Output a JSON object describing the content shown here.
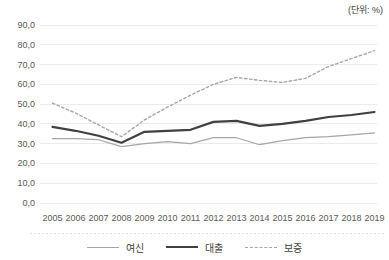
{
  "chart": {
    "unit_label": "(단위: %)",
    "colors": {
      "background": "#ffffff",
      "gridline": "#ebebeb",
      "axis_text": "#595959",
      "separator": "#e0e0e0",
      "series_gray": "#a6a6a6",
      "series_dark": "#404040"
    }
  },
  "chart_data": {
    "type": "line",
    "title": "",
    "unit": "(단위: %)",
    "categories": [
      "2005",
      "2006",
      "2007",
      "2008",
      "2009",
      "2010",
      "2011",
      "2012",
      "2013",
      "2014",
      "2015",
      "2016",
      "2017",
      "2018",
      "2019"
    ],
    "series": [
      {
        "name": "여신",
        "key": "yeosin",
        "color": "#a6a6a6",
        "width": 1.2,
        "dash": "",
        "values": [
          32.5,
          32.5,
          32.0,
          28.5,
          30.0,
          31.0,
          30.0,
          33.0,
          33.0,
          29.5,
          31.5,
          33.0,
          33.5,
          34.5,
          35.5
        ]
      },
      {
        "name": "대출",
        "key": "daechul",
        "color": "#404040",
        "width": 2.2,
        "dash": "",
        "values": [
          38.5,
          36.5,
          34.0,
          30.5,
          36.0,
          36.5,
          37.0,
          41.0,
          41.5,
          39.0,
          40.0,
          41.5,
          43.5,
          44.5,
          46.0
        ]
      },
      {
        "name": "보증",
        "key": "bojeung",
        "color": "#a6a6a6",
        "width": 1.4,
        "dash": "2.5,2.5",
        "values": [
          50.5,
          45.5,
          39.5,
          33.5,
          42.0,
          48.5,
          54.5,
          60.0,
          63.5,
          62.0,
          61.0,
          63.0,
          69.0,
          73.0,
          77.0
        ]
      }
    ],
    "ylim": [
      0,
      90
    ],
    "ytick_step": 10,
    "ytick_labels": [
      "0,0",
      "10,0",
      "20,0",
      "30,0",
      "40,0",
      "50,0",
      "60,0",
      "70,0",
      "80,0",
      "90,0"
    ],
    "grid": "horizontal",
    "legend_position": "bottom"
  }
}
